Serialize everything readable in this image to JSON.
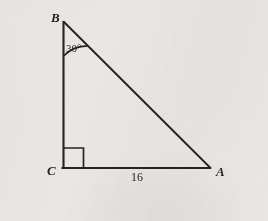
{
  "figure": {
    "background_color": "#e9e7e3",
    "stroke_color": "#262320",
    "labels": {
      "vertex_b": "B",
      "vertex_c": "C",
      "vertex_a": "A",
      "angle_b": "30°",
      "side_ca": "16"
    },
    "geometry": {
      "vertex_b": {
        "x": 63.5,
        "y": 22
      },
      "vertex_c": {
        "x": 63.5,
        "y": 168
      },
      "vertex_a": {
        "x": 210,
        "y": 168
      },
      "right_angle_marker": {
        "x": 63.5,
        "y": 148,
        "size": 20
      },
      "angle_arc_radius": 34
    },
    "measures": {
      "angle_at_b_degrees": 30,
      "angle_at_c_degrees": 90,
      "angle_at_a_degrees": 60,
      "side_ca_length": 16
    }
  }
}
